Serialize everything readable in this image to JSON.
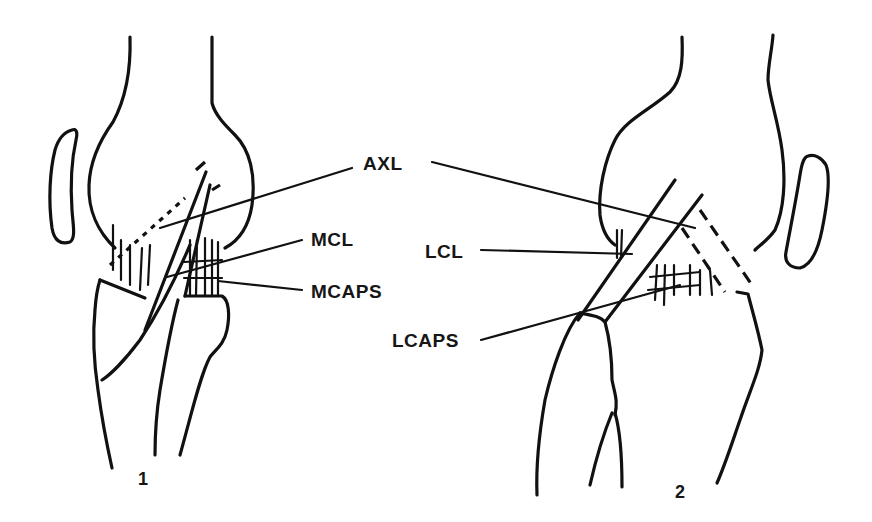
{
  "diagram": {
    "type": "anatomical line drawing",
    "colors": {
      "ink": "#111111",
      "background": "#ffffff"
    },
    "figures": [
      {
        "number": "1",
        "view": "medial",
        "labels": [
          {
            "id": "axl",
            "text": "AXL"
          },
          {
            "id": "mcl",
            "text": "MCL"
          },
          {
            "id": "mcaps",
            "text": "MCAPS"
          }
        ]
      },
      {
        "number": "2",
        "view": "lateral",
        "labels": [
          {
            "id": "axl",
            "text": "AXL"
          },
          {
            "id": "lcl",
            "text": "LCL"
          },
          {
            "id": "lcaps",
            "text": "LCAPS"
          }
        ]
      }
    ],
    "labels": {
      "axl": "AXL",
      "mcl": "MCL",
      "mcaps": "MCAPS",
      "lcl": "LCL",
      "lcaps": "LCAPS"
    },
    "figure_numbers": {
      "left": "1",
      "right": "2"
    }
  }
}
